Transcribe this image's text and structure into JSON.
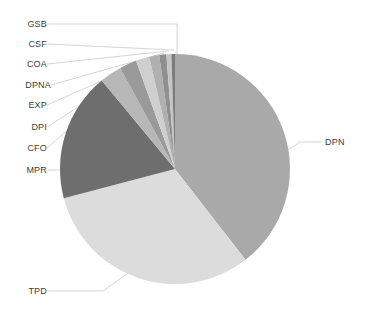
{
  "chart_data": {
    "type": "pie",
    "title": "",
    "subtitle": "",
    "xlabel": "",
    "ylabel": "",
    "legend_position": "none",
    "grid": false,
    "labels_placement": "outside-with-leader-lines",
    "start_angle_deg": 0,
    "direction": "clockwise",
    "categories": [
      "DPN",
      "TPD",
      "MPR",
      "CFO",
      "DPI",
      "EXP",
      "DPNA",
      "COA",
      "CSF",
      "GSB"
    ],
    "values": [
      39.5,
      31.4,
      18.1,
      3.1,
      2.4,
      1.9,
      1.4,
      1.0,
      0.7,
      0.5
    ],
    "unit": "%",
    "colors": [
      "#a9a9a9",
      "#dcdcdc",
      "#6e6e6e",
      "#b7b7b7",
      "#9a9a9a",
      "#cfcfcf",
      "#b0b0b0",
      "#8f8f8f",
      "#c5c5c5",
      "#7c7c7c"
    ],
    "slices": [
      {
        "label": "DPN",
        "value": 39.5,
        "color": "#a9a9a9"
      },
      {
        "label": "TPD",
        "value": 31.4,
        "color": "#dcdcdc"
      },
      {
        "label": "MPR",
        "value": 18.1,
        "color": "#6e6e6e"
      },
      {
        "label": "CFO",
        "value": 3.1,
        "color": "#b7b7b7"
      },
      {
        "label": "DPI",
        "value": 2.4,
        "color": "#9a9a9a"
      },
      {
        "label": "EXP",
        "value": 1.9,
        "color": "#cfcfcf"
      },
      {
        "label": "DPNA",
        "value": 1.4,
        "color": "#b0b0b0"
      },
      {
        "label": "COA",
        "value": 1.0,
        "color": "#8f8f8f"
      },
      {
        "label": "CSF",
        "value": 0.7,
        "color": "#c5c5c5"
      },
      {
        "label": "GSB",
        "value": 0.5,
        "color": "#7c7c7c"
      }
    ]
  },
  "labels": {
    "gsb": "GSB",
    "csf": "CSF",
    "coa": "COA",
    "dpna": "DPNA",
    "exp": "EXP",
    "dpi": "DPI",
    "cfo": "CFO",
    "mpr": "MPR",
    "tpd": "TPD",
    "dpn": "DPN"
  },
  "style": {
    "background": "#ffffff",
    "leader_line_color": "#d0d0d0",
    "label_text_color": "#3c3c3c"
  }
}
